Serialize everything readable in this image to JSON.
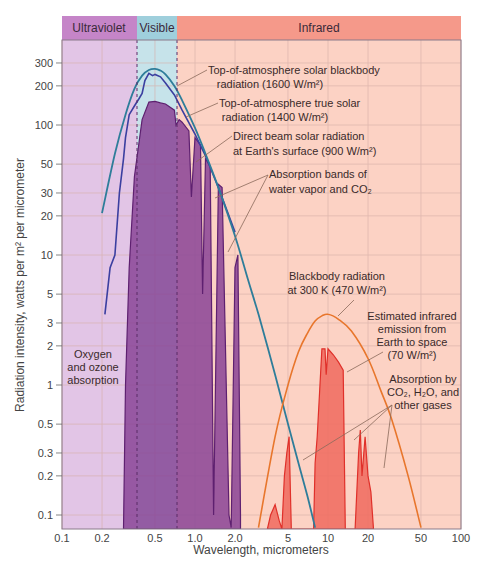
{
  "chart_data": {
    "type": "line",
    "title": "",
    "xlabel": "Wavelength, micrometers",
    "ylabel": "Radiation intensity, watts per m² per micrometer",
    "xscale": "log",
    "yscale": "log",
    "xlim": [
      0.1,
      100
    ],
    "ylim": [
      0.07,
      450
    ],
    "grid": true,
    "x_ticks": [
      "0.1",
      "0.2",
      "0.5",
      "1.0",
      "2.0",
      "5",
      "10",
      "20",
      "50",
      "100"
    ],
    "x_tick_values": [
      0.1,
      0.2,
      0.5,
      1,
      2,
      5,
      10,
      20,
      50,
      100
    ],
    "y_ticks": [
      "300",
      "200",
      "100",
      "50",
      "30",
      "20",
      "10",
      "5",
      "3",
      "2",
      "1",
      "0.5",
      "0.3",
      "0.2",
      "0.1"
    ],
    "y_tick_values": [
      300,
      200,
      100,
      50,
      30,
      20,
      10,
      5,
      3,
      2,
      1,
      0.5,
      0.3,
      0.2,
      0.1
    ],
    "bands": [
      {
        "label": "Ultraviolet",
        "from": 0.1,
        "to": 0.4,
        "color": "#c080c0"
      },
      {
        "label": "Visible",
        "from": 0.4,
        "to": 0.76,
        "color": "#9ecfdc"
      },
      {
        "label": "Infrared",
        "from": 0.76,
        "to": 100,
        "color": "#f59a88"
      }
    ],
    "series": [
      {
        "name": "Top-of-atmosphere solar blackbody radiation (1600 W/m²)",
        "style": "line",
        "color": "#2e7d9a",
        "x": [
          0.2,
          0.25,
          0.3,
          0.35,
          0.4,
          0.45,
          0.5,
          0.55,
          0.6,
          0.7,
          0.8,
          1.0,
          1.2,
          1.5,
          2.0,
          2.5,
          3.0,
          4.0,
          5.0,
          6.0,
          7.0,
          8.0
        ],
        "y": [
          21,
          60,
          120,
          190,
          240,
          265,
          270,
          262,
          245,
          200,
          155,
          95,
          60,
          33,
          14,
          6.5,
          3.5,
          1.2,
          0.5,
          0.25,
          0.14,
          0.08
        ]
      },
      {
        "name": "Top-of-atmosphere true solar radiation (1400 W/m²)",
        "style": "line",
        "color": "#3b3fa0",
        "x": [
          0.21,
          0.23,
          0.25,
          0.27,
          0.29,
          0.3,
          0.32,
          0.35,
          0.38,
          0.4,
          0.42,
          0.45,
          0.48,
          0.5,
          0.55,
          0.6,
          0.7,
          0.8,
          1.0,
          1.2,
          1.5,
          2.0
        ],
        "y": [
          3.5,
          8,
          10,
          30,
          55,
          80,
          120,
          140,
          160,
          175,
          220,
          250,
          240,
          245,
          235,
          210,
          170,
          130,
          85,
          58,
          33,
          15
        ]
      },
      {
        "name": "Direct beam solar radiation at Earth's surface (900 W/m²)",
        "style": "area",
        "color": "#7e3a8e",
        "x": [
          0.29,
          0.3,
          0.32,
          0.35,
          0.4,
          0.45,
          0.5,
          0.55,
          0.6,
          0.7,
          0.72,
          0.76,
          0.8,
          0.9,
          0.94,
          1.0,
          1.1,
          1.14,
          1.2,
          1.3,
          1.38,
          1.5,
          1.6,
          1.8,
          1.87,
          2.0,
          2.1,
          2.2
        ],
        "y": [
          0.07,
          1,
          8,
          40,
          110,
          150,
          152,
          148,
          145,
          130,
          100,
          110,
          105,
          90,
          28,
          80,
          70,
          5,
          55,
          48,
          0.1,
          35,
          33,
          0.1,
          0.08,
          8,
          10,
          0.1
        ]
      },
      {
        "name": "Blackbody radiation at 300 K (470 W/m²)",
        "style": "line",
        "color": "#e87a30",
        "x": [
          3.0,
          4.0,
          5.0,
          6.0,
          7.0,
          8.0,
          9.0,
          10.0,
          12.0,
          15.0,
          20.0,
          25.0,
          30.0,
          40.0,
          50.0
        ],
        "y": [
          0.08,
          0.4,
          1.0,
          1.8,
          2.5,
          3.1,
          3.4,
          3.5,
          3.2,
          2.6,
          1.6,
          0.9,
          0.55,
          0.2,
          0.08
        ]
      },
      {
        "name": "Estimated infrared emission from Earth to space (70 W/m²)",
        "style": "area",
        "color": "#f0645a",
        "x": [
          3.5,
          3.7,
          4.0,
          4.3,
          4.5,
          4.7,
          4.9,
          5.1,
          5.3,
          7.8,
          8.0,
          8.3,
          9.0,
          9.5,
          9.7,
          10.0,
          11.0,
          12.0,
          13.0,
          13.5,
          16.0,
          17.0,
          17.5,
          18.0,
          19.0,
          20.0,
          21.0,
          22.0
        ],
        "y": [
          0.07,
          0.1,
          0.12,
          0.09,
          0.07,
          0.2,
          0.3,
          0.4,
          0.07,
          0.07,
          0.25,
          0.4,
          1.9,
          1.9,
          1.2,
          1.9,
          1.7,
          1.5,
          1.3,
          0.07,
          0.07,
          0.3,
          0.45,
          0.2,
          0.4,
          0.2,
          0.15,
          0.07
        ]
      }
    ],
    "annotations": [
      {
        "text": "Top-of-atmosphere solar blackbody radiation (1600 W/m²)"
      },
      {
        "text": "Top-of-atmosphere true solar radiation (1400 W/m²)"
      },
      {
        "text": "Direct beam solar radiation at Earth's surface (900 W/m²)"
      },
      {
        "text": "Absorption bands of water vapor and CO₂"
      },
      {
        "text": "Blackbody radiation at 300 K (470 W/m²)"
      },
      {
        "text": "Estimated infrared emission from Earth to space (70 W/m²)"
      },
      {
        "text": "Absorption by CO₂, H₂O, and other gases"
      },
      {
        "text": "Oxygen and ozone absorption"
      }
    ]
  },
  "labels": {
    "band_uv": "Ultraviolet",
    "band_vis": "Visible",
    "band_ir": "Infrared",
    "xlabel": "Wavelength, micrometers",
    "ylabel": "Radiation intensity, watts per m² per micrometer",
    "ann_bb_1": "Top-of-atmosphere solar blackbody",
    "ann_bb_2": "radiation (1600 W/m²)",
    "ann_true_1": "Top-of-atmosphere true solar",
    "ann_true_2": "radiation (1400 W/m²)",
    "ann_direct_1": "Direct beam solar radiation",
    "ann_direct_2": "at Earth's surface (900 W/m²)",
    "ann_abs_1": "Absorption bands of",
    "ann_abs_2": "water vapor and CO₂",
    "ann_300k_1": "Blackbody radiation",
    "ann_300k_2": "at 300 K (470 W/m²)",
    "ann_ir_1": "Estimated infrared",
    "ann_ir_2": "emission from",
    "ann_ir_3": "Earth to space",
    "ann_ir_4": "(70 W/m²)",
    "ann_gas_1": "Absorption by",
    "ann_gas_2": "CO₂, H₂O, and",
    "ann_gas_3": "other gases",
    "ann_oz_1": "Oxygen",
    "ann_oz_2": "and ozone",
    "ann_oz_3": "absorption"
  }
}
